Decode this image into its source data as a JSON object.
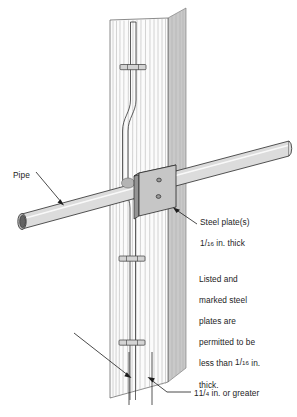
{
  "figure": {
    "type": "technical-line-illustration"
  },
  "labels": {
    "pipe": "Pipe",
    "steel_plate_line1": "Steel plate(s)",
    "steel_plate_fraction_numerator": "1",
    "steel_plate_fraction_slash": "/",
    "steel_plate_fraction_denominator": "16",
    "steel_plate_line2_suffix": " in. thick",
    "note_line1": "Listed and",
    "note_line2": "marked steel",
    "note_line3": "plates are",
    "note_line4": "permitted to be",
    "note_line5_prefix": "less than ",
    "note_fraction_numerator": "1",
    "note_fraction_slash": "/",
    "note_fraction_denominator": "16",
    "note_line5_suffix": " in.",
    "note_line6": "thick.",
    "dimension_prefix": "1",
    "dimension_fraction_numerator": "1",
    "dimension_fraction_slash": "/",
    "dimension_fraction_denominator": "4",
    "dimension_suffix": " in. or greater"
  },
  "colors": {
    "outline": "#1d1d1d",
    "plate_face": "#c6c6c6",
    "plate_edge": "#8f8f8f",
    "plate_top": "#b2b2b2",
    "pipe_body": "#dcdcdc",
    "pipe_end_dark": "#606060",
    "pipe_end_ring": "#bdbdbd",
    "stud_face": "#fbfbfb",
    "stud_side": "#c9c9c9",
    "stud_grain": "#b9b9b9",
    "cable": "#ffffff",
    "staple": "#d2d2d2",
    "text": "#1d1d1d",
    "background": "#ffffff"
  },
  "parts": [
    {
      "name": "wood-stud",
      "description": "vertical wood stud with grain lines"
    },
    {
      "name": "electrical-cable",
      "description": "cable routed vertically, jogging around the pipe"
    },
    {
      "name": "cable-staples",
      "count": 3,
      "description": "horizontal staples securing cable to stud"
    },
    {
      "name": "pipe",
      "description": "round pipe passing through the stud at a shallow upward angle"
    },
    {
      "name": "steel-plate",
      "description": "rectangular steel plate with two fastener holes"
    },
    {
      "name": "fastener-holes",
      "count": 2
    }
  ]
}
